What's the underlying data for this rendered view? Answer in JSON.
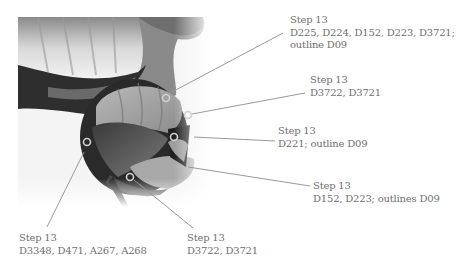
{
  "figure": {
    "type": "annotated-embroidery-photo",
    "annotations": [
      {
        "id": "a1",
        "step": "Step 13",
        "threads": "D225, D224, D152, D223, D3721;",
        "extra": "outline D09"
      },
      {
        "id": "a2",
        "step": "Step 13",
        "threads": "D3722, D3721",
        "extra": ""
      },
      {
        "id": "a3",
        "step": "Step 13",
        "threads": "D221; outline D09",
        "extra": ""
      },
      {
        "id": "a4",
        "step": "Step 13",
        "threads": "D152, D223; outlines D09",
        "extra": ""
      },
      {
        "id": "a5",
        "step": "Step 13",
        "threads": "D3348, D471, A267, A268",
        "extra": ""
      },
      {
        "id": "a6",
        "step": "Step 13",
        "threads": "D3722, D3721",
        "extra": ""
      }
    ],
    "colors": {
      "leader_line": "#9a9a9a",
      "label_text": "#707070",
      "marker_ring": "#c8c8c8"
    }
  }
}
